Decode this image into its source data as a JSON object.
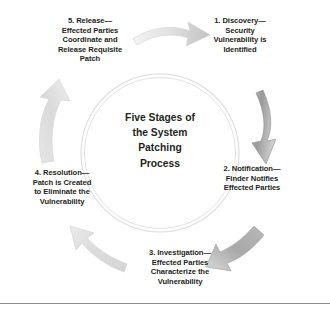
{
  "diagram": {
    "center_title_lines": [
      "Five Stages of",
      "the System",
      "Patching",
      "Process"
    ],
    "center_title_text": "Five Stages of the System Patching Process",
    "colors": {
      "text": "#231f20",
      "arrow_light": "#e9e9e9",
      "arrow_mid": "#c9c9c9",
      "arrow_dark": "#8e8e8e",
      "ring": "#d8d8d8",
      "rule": "#8d8d8d",
      "background": "#ffffff"
    },
    "ring": {
      "center_x": 160,
      "center_y": 153,
      "radius_outer": 79,
      "radius_inner": 75
    },
    "stages": [
      {
        "id": "stage-1",
        "number": "1.",
        "heading": "1. Discovery—",
        "lines": [
          "Security",
          "Vulnerability is",
          "Identified"
        ],
        "text": "1. Discovery—Security Vulnerability is Identified"
      },
      {
        "id": "stage-2",
        "number": "2.",
        "heading": "2. Notification—",
        "lines": [
          "Finder Notifies",
          "Effected Parties"
        ],
        "text": "2. Notification—Finder Notifies Effected Parties"
      },
      {
        "id": "stage-3",
        "number": "3.",
        "heading": "3. Investigation—",
        "lines": [
          "Effected Parties",
          "Characterize the",
          "Vulnerability"
        ],
        "text": "3. Investigation—Effected Parties Characterize the Vulnerability"
      },
      {
        "id": "stage-4",
        "number": "4.",
        "heading": "4. Resolution—",
        "lines": [
          "Patch is Created",
          "to Eliminate the",
          "Vulnerability"
        ],
        "text": "4. Resolution—Patch is Created to Eliminate the Vulnerability"
      },
      {
        "id": "stage-5",
        "number": "5.",
        "heading": "5. Release—",
        "lines": [
          "Effected Parties",
          "Coordinate and",
          "Release Requisite",
          "Patch"
        ],
        "text": "5. Release—Effected Parties Coordinate and Release Requisite Patch"
      }
    ],
    "arrows": [
      {
        "id": "arrow-top",
        "from": "stage-5",
        "to": "stage-1",
        "direction": "right"
      },
      {
        "id": "arrow-right",
        "from": "stage-1",
        "to": "stage-2",
        "direction": "down"
      },
      {
        "id": "arrow-bottom-right",
        "from": "stage-2",
        "to": "stage-3",
        "direction": "down-left"
      },
      {
        "id": "arrow-bottom-left",
        "from": "stage-3",
        "to": "stage-4",
        "direction": "up-left"
      },
      {
        "id": "arrow-left",
        "from": "stage-4",
        "to": "stage-5",
        "direction": "up"
      }
    ]
  }
}
